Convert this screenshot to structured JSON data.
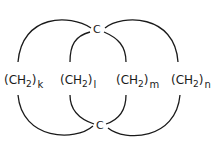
{
  "diagram": {
    "type": "bicyclic structural formula",
    "atoms": {
      "top": "C",
      "bottom": "C"
    },
    "bridges": [
      {
        "group": "(CH",
        "sub": "2",
        "close": ")",
        "index": "k"
      },
      {
        "group": "(CH",
        "sub": "2",
        "close": ")",
        "index": "l"
      },
      {
        "group": "(CH",
        "sub": "2",
        "close": ")",
        "index": "m"
      },
      {
        "group": "(CH",
        "sub": "2",
        "close": ")",
        "index": "n"
      }
    ],
    "stroke_color": "#1a1a1a"
  }
}
